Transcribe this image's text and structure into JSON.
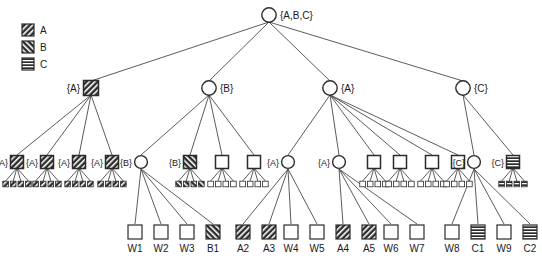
{
  "figure": {
    "type": "hierarchical-tree-diagram",
    "background": "#ffffff",
    "stroke_color": "#1a1a1a",
    "fill_white": "#ffffff"
  },
  "legend": {
    "items": [
      {
        "swatch": "pattern-a-swatch",
        "pattern": "diagonal-forward",
        "label": "A"
      },
      {
        "swatch": "pattern-b-swatch",
        "pattern": "diagonal-back",
        "label": "B"
      },
      {
        "swatch": "pattern-c-swatch",
        "pattern": "horizontal-lines",
        "label": "C"
      }
    ]
  },
  "tree": {
    "root": {
      "label": "{A,B,C}",
      "shape": "circle",
      "pattern": "none"
    },
    "level2": [
      {
        "label": "{A}",
        "shape": "square",
        "pattern": "A",
        "label_side": "left"
      },
      {
        "label": "{B}",
        "shape": "circle",
        "pattern": "none",
        "label_side": "right"
      },
      {
        "label": "{A}",
        "shape": "circle",
        "pattern": "none",
        "label_side": "right"
      },
      {
        "label": "{C}",
        "shape": "circle",
        "pattern": "none",
        "label_side": "right"
      }
    ],
    "level3": [
      {
        "label": "{A}",
        "shape": "square",
        "pattern": "A",
        "leaves": 4,
        "leaf_pattern": "A"
      },
      {
        "label": "{A}",
        "shape": "square",
        "pattern": "A",
        "leaves": 4,
        "leaf_pattern": "A"
      },
      {
        "label": "{A}",
        "shape": "square",
        "pattern": "A",
        "leaves": 4,
        "leaf_pattern": "A"
      },
      {
        "label": "{A}",
        "shape": "square",
        "pattern": "A",
        "leaves": 4,
        "leaf_pattern": "A"
      },
      {
        "label": "{B}",
        "shape": "circle",
        "pattern": "none",
        "leaves": 0,
        "leaf_pattern": "none"
      },
      {
        "label": "{B}",
        "shape": "square",
        "pattern": "B",
        "leaves": 4,
        "leaf_pattern": "B"
      },
      {
        "label": "",
        "shape": "square",
        "pattern": "none",
        "leaves": 4,
        "leaf_pattern": "none"
      },
      {
        "label": "",
        "shape": "square",
        "pattern": "none",
        "leaves": 4,
        "leaf_pattern": "none"
      },
      {
        "label": "{A}",
        "shape": "circle",
        "pattern": "none",
        "leaves": 0,
        "leaf_pattern": "none"
      },
      {
        "label": "{A}",
        "shape": "circle",
        "pattern": "none",
        "leaves": 0,
        "leaf_pattern": "none"
      },
      {
        "label": "",
        "shape": "square",
        "pattern": "none",
        "leaves": 4,
        "leaf_pattern": "none"
      },
      {
        "label": "",
        "shape": "square",
        "pattern": "none",
        "leaves": 4,
        "leaf_pattern": "none"
      },
      {
        "label": "",
        "shape": "square",
        "pattern": "none",
        "leaves": 4,
        "leaf_pattern": "none"
      },
      {
        "label": "",
        "shape": "square",
        "pattern": "none",
        "leaves": 4,
        "leaf_pattern": "none"
      },
      {
        "label": "{C}",
        "shape": "circle",
        "pattern": "none",
        "leaves": 0,
        "leaf_pattern": "none"
      },
      {
        "label": "{C}",
        "shape": "square",
        "pattern": "C",
        "leaves": 4,
        "leaf_pattern": "C"
      }
    ],
    "named_leaves": [
      {
        "label": "W1",
        "pattern": "none"
      },
      {
        "label": "W2",
        "pattern": "none"
      },
      {
        "label": "W3",
        "pattern": "none"
      },
      {
        "label": "B1",
        "pattern": "B"
      },
      {
        "label": "A2",
        "pattern": "A"
      },
      {
        "label": "A3",
        "pattern": "A"
      },
      {
        "label": "W4",
        "pattern": "none"
      },
      {
        "label": "W5",
        "pattern": "none"
      },
      {
        "label": "A4",
        "pattern": "A"
      },
      {
        "label": "A5",
        "pattern": "A"
      },
      {
        "label": "W6",
        "pattern": "none"
      },
      {
        "label": "W7",
        "pattern": "none"
      },
      {
        "label": "W8",
        "pattern": "none"
      },
      {
        "label": "C1",
        "pattern": "C"
      },
      {
        "label": "W9",
        "pattern": "none"
      },
      {
        "label": "C2",
        "pattern": "C"
      }
    ]
  }
}
